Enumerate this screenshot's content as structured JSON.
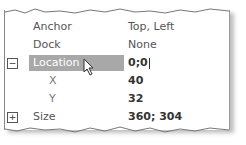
{
  "properties": [
    {
      "name": "Anchor",
      "value": "Top, Left"
    },
    {
      "name": "Dock",
      "value": "None"
    },
    {
      "name": "Location",
      "value": "0;0",
      "expander": "−",
      "selected": true
    },
    {
      "name": "X",
      "value": "40"
    },
    {
      "name": "Y",
      "value": "32"
    },
    {
      "name": "Size",
      "value": "360; 304",
      "expander": "+"
    }
  ],
  "colors": {
    "selection": "#a8a8a8",
    "border": "#888888"
  }
}
